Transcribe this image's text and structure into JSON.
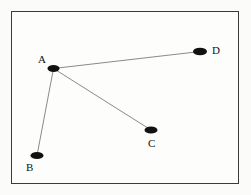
{
  "figure": {
    "background_color": "#fbfbfa",
    "frame_color": "#3a3a3a",
    "node_color": "#111111",
    "edge_color": "#7d7d7d",
    "label_color": "#111111"
  },
  "frame": {
    "x": 11,
    "y": 11,
    "width": 228,
    "height": 173
  },
  "chart_data": {
    "type": "scatter",
    "title": "",
    "xlabel": "",
    "ylabel": "",
    "grid": false,
    "legend": false,
    "xlim": [
      11,
      239
    ],
    "ylim": [
      11,
      184
    ],
    "nodes": [
      {
        "id": "A",
        "label": "A",
        "cx": 53.5,
        "cy": 68.5,
        "rx": 6.0,
        "ry": 3.4,
        "label_x": 38,
        "label_y": 54
      },
      {
        "id": "B",
        "label": "B",
        "cx": 37.0,
        "cy": 155.5,
        "rx": 6.5,
        "ry": 3.6,
        "label_x": 26,
        "label_y": 162
      },
      {
        "id": "C",
        "label": "C",
        "cx": 151.0,
        "cy": 130.0,
        "rx": 6.5,
        "ry": 3.6,
        "label_x": 148,
        "label_y": 138
      },
      {
        "id": "D",
        "label": "D",
        "cx": 200.0,
        "cy": 51.5,
        "rx": 7.0,
        "ry": 3.8,
        "label_x": 212,
        "label_y": 45
      }
    ],
    "edges": [
      {
        "from": "A",
        "to": "D"
      },
      {
        "from": "A",
        "to": "C"
      },
      {
        "from": "A",
        "to": "B"
      }
    ]
  }
}
